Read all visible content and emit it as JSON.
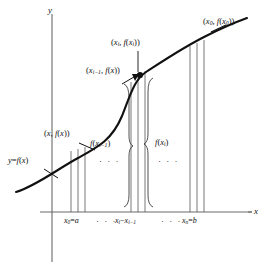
{
  "figure": {
    "type": "calculus-arc-length-diagram",
    "width": 267,
    "height": 273,
    "background": "#ffffff",
    "ink": "#111111"
  },
  "axes": {
    "x_axis_name": "x",
    "y_axis_name": "y",
    "x_axis": {
      "x1": 40,
      "y1": 212,
      "x2": 252,
      "y2": 212
    },
    "y_axis": {
      "x1": 52,
      "y1": 14,
      "x2": 52,
      "y2": 262
    }
  },
  "curve": {
    "label": "y = f(x)",
    "label_parts": {
      "y": "y",
      "eq": "=",
      "f": "f",
      "open": "(",
      "x": "x",
      "close": ")"
    },
    "stroke": "#111111",
    "stroke_width": 2.1,
    "path": "M 16,192 C 36,186 56,170 78,158 C 98,147 112,140 122,116 C 130,96 134,80 146,72 C 160,63 182,48 206,36 C 224,27 236,22 247,18"
  },
  "points": [
    {
      "id": "point-x-fx",
      "text": "(x, f(x))",
      "parts": {
        "open": "(",
        "x": "x",
        "comma": ",",
        "f": "f",
        "arg_open": "(",
        "arg": "x",
        "arg_close": ")",
        "close": ")"
      },
      "label_x": 44,
      "label_y": 133,
      "leader": {
        "x1": 78,
        "y1": 143,
        "x2": 93,
        "y2": 150
      }
    },
    {
      "id": "point-xi-minus-1",
      "text": "(x_{i-1}, f(x))",
      "parts": {
        "open": "(",
        "x": "x",
        "sub": "i−1",
        "comma": ",",
        "f": "f",
        "arg_open": "(",
        "arg": "x",
        "arg_close": ")",
        "close": ")"
      },
      "label_x": 86,
      "label_y": 70,
      "leader": {
        "x1": 131,
        "y1": 80,
        "x2": 140,
        "y2": 76
      }
    },
    {
      "id": "point-xi",
      "text": "(x_i, f(x_i))",
      "parts": {
        "open": "(",
        "x": "x",
        "sub": "i",
        "comma": ",",
        "f": "f",
        "arg_open": "(",
        "arg": "x",
        "arg_sub": "i",
        "arg_close": ")",
        "close": ")"
      },
      "label_x": 111,
      "label_y": 42,
      "leader": {
        "x1": 138,
        "y1": 50,
        "x2": 138,
        "y2": 72
      }
    },
    {
      "id": "point-x0-fx0",
      "text": "(x_0, f(x_0))",
      "parts": {
        "open": "(",
        "x": "x",
        "sub": "0",
        "comma": ",",
        "f": "f",
        "arg_open": "(",
        "arg": "x",
        "arg_sub": "0",
        "arg_close": ")",
        "close": ")"
      },
      "label_x": 203,
      "label_y": 21,
      "leader": {
        "x1": 212,
        "y1": 31,
        "x2": 224,
        "y2": 25
      }
    }
  ],
  "dot_marker": {
    "cx": 140,
    "cy": 75,
    "r": 3.1
  },
  "ticks": [
    {
      "id": "tick-x0-a",
      "text": "x_0 = a",
      "parts": {
        "x": "x",
        "sub": "0",
        "eq": "=",
        "val": "a"
      },
      "label_x": 68,
      "label_y": 221
    },
    {
      "id": "tick-xi-diff",
      "text": "x_i − x_{i−1}",
      "parts": {
        "x1": "x",
        "sub1": "i",
        "minus": "−",
        "x2": "x",
        "sub2": "i−1"
      },
      "label_x": 119,
      "label_y": 221
    },
    {
      "id": "tick-xn-b",
      "text": "x_n = b",
      "parts": {
        "x": "x",
        "sub": "n",
        "eq": "=",
        "val": "b"
      },
      "label_x": 185,
      "label_y": 221
    }
  ],
  "axis_ellipses": [
    {
      "id": "axis-ellipsis-left",
      "text": "· · ·",
      "x": 98,
      "y": 220
    },
    {
      "id": "axis-ellipsis-right",
      "text": "· · ·",
      "x": 163,
      "y": 220
    }
  ],
  "brace_labels": [
    {
      "id": "brace-label-f-xi-minus-1",
      "text": "f(x_{i−1})",
      "parts": {
        "f": "f",
        "open": "(",
        "x": "x",
        "sub": "i−1",
        "close": ")"
      },
      "label_x": 92,
      "label_y": 145,
      "ellipsis": "· · ·",
      "ellipsis_x": 101,
      "ellipsis_y": 161
    },
    {
      "id": "brace-label-f-xi",
      "text": "f(x_i)",
      "parts": {
        "f": "f",
        "open": "(",
        "x": "x",
        "sub": "i",
        "close": ")"
      },
      "label_x": 146,
      "label_y": 143,
      "ellipsis": "· · ·",
      "ellipsis_x": 150,
      "ellipsis_y": 161
    }
  ],
  "vertical_lines": {
    "stroke": "#555555",
    "stroke_width": 0.8,
    "left_group": [
      {
        "x": 71,
        "y_top": 151,
        "y_bottom": 212
      },
      {
        "x": 78,
        "y_top": 149,
        "y_bottom": 212
      },
      {
        "x": 85,
        "y_top": 147,
        "y_bottom": 212
      }
    ],
    "middle_group": [
      {
        "x": 131,
        "y_top": 82,
        "y_bottom": 212
      },
      {
        "x": 138,
        "y_top": 74,
        "y_bottom": 212
      },
      {
        "x": 145,
        "y_top": 71,
        "y_bottom": 212
      }
    ],
    "right_group": [
      {
        "x": 190,
        "y_top": 46,
        "y_bottom": 212
      },
      {
        "x": 197,
        "y_top": 43,
        "y_bottom": 212
      },
      {
        "x": 204,
        "y_top": 40,
        "y_bottom": 212
      }
    ]
  },
  "braces": [
    {
      "id": "brace-left-middle",
      "direction": "right",
      "x": 127,
      "y_top": 84,
      "y_bottom": 207
    },
    {
      "id": "brace-right-middle",
      "direction": "left",
      "x": 150,
      "y_top": 78,
      "y_bottom": 207
    }
  ]
}
